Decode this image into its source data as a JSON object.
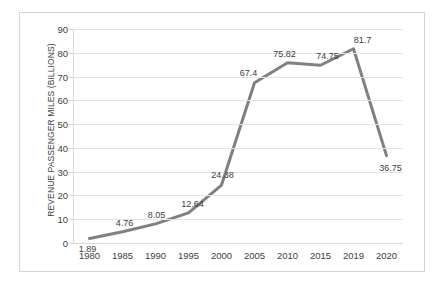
{
  "chart_data": {
    "type": "line",
    "title": "",
    "subtitle": "",
    "xlabel": "",
    "ylabel": "REVENUE PASSENGER MILES (BILLIONS)",
    "categories": [
      "1980",
      "1985",
      "1990",
      "1995",
      "2000",
      "2005",
      "2010",
      "2015",
      "2019",
      "2020"
    ],
    "values": [
      1.89,
      4.76,
      8.05,
      12.64,
      24.38,
      67.4,
      75.82,
      74.75,
      81.7,
      36.75
    ],
    "data_labels": [
      "1.89",
      "4.76",
      "8.05",
      "12.64",
      "24.38",
      "67.4",
      "75.82",
      "74.75",
      "81.7",
      "36.75"
    ],
    "ylim": [
      0,
      90
    ],
    "y_ticks": [
      0,
      10,
      20,
      30,
      40,
      50,
      60,
      70,
      80,
      90
    ],
    "y_tick_labels": [
      "0",
      "10",
      "20",
      "30",
      "40",
      "50",
      "60",
      "70",
      "80",
      "90"
    ],
    "grid": {
      "horizontal": true,
      "vertical": false
    },
    "legend": {
      "visible": false,
      "position": "none",
      "entries": []
    },
    "series": [
      {
        "name": "Revenue Passenger Miles",
        "color": "#808080",
        "line_width": 3,
        "markers": false,
        "values": [
          1.89,
          4.76,
          8.05,
          12.64,
          24.38,
          67.4,
          75.82,
          74.75,
          81.7,
          36.75
        ]
      }
    ],
    "colors": {
      "line": "#808080",
      "gridline": "#e3e3e3",
      "axis": "#d9d9d9",
      "text": "#404040",
      "frame": "#d4d4d4",
      "background": "#ffffff"
    },
    "annotations": []
  }
}
